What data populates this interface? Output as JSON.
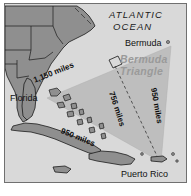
{
  "figure": {
    "name": "bermuda-triangle-map",
    "background_color": "#d9d9d9",
    "border_color": "#707070",
    "land_color": "#8f8f8f",
    "land_outline_color": "#1a1a1a",
    "triangle_fill_color": "#b8b8b8",
    "triangle_label_color": "#9a9a9a"
  },
  "labels": {
    "ocean_line1": "ATLANTIC",
    "ocean_line2": "OCEAN",
    "bermuda": "Bermuda",
    "florida": "Florida",
    "puerto_rico": "Puerto Rico",
    "triangle_name_line1": "Bermuda",
    "triangle_name_line2": "Triangle"
  },
  "distances": {
    "northwest_side": "1,150 miles",
    "middle_dashed": "756 miles",
    "east_side": "950 miles",
    "southwest_side": "950 miles"
  },
  "geometry": {
    "vertices": [
      {
        "name": "Florida",
        "x": 42,
        "y": 94
      },
      {
        "name": "Bermuda",
        "x": 166,
        "y": 42
      },
      {
        "name": "Puerto Rico",
        "x": 156,
        "y": 158
      }
    ],
    "right_angle_marker_at": "Bermuda"
  },
  "landmasses": [
    "Southeastern United States",
    "Florida peninsula",
    "Bahamas",
    "Cuba",
    "Jamaica",
    "Hispaniola",
    "Puerto Rico"
  ]
}
